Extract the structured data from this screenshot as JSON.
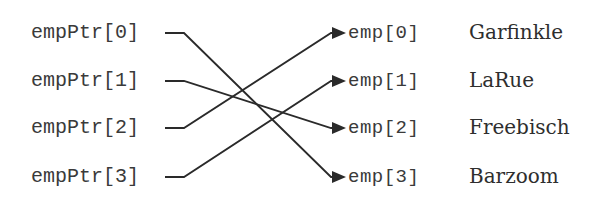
{
  "diagram": {
    "pointers": [
      {
        "label": "empPtr[0]",
        "points_to": 3
      },
      {
        "label": "empPtr[1]",
        "points_to": 2
      },
      {
        "label": "empPtr[2]",
        "points_to": 0
      },
      {
        "label": "empPtr[3]",
        "points_to": 1
      }
    ],
    "employees": [
      {
        "label": "emp[0]",
        "name": "Garfinkle"
      },
      {
        "label": "emp[1]",
        "name": "LaRue"
      },
      {
        "label": "emp[2]",
        "name": "Freebisch"
      },
      {
        "label": "emp[3]",
        "name": "Barzoom"
      }
    ],
    "colors": {
      "line": "#2a2a2a",
      "text": "#3a3a3a",
      "background": "#ffffff"
    }
  }
}
